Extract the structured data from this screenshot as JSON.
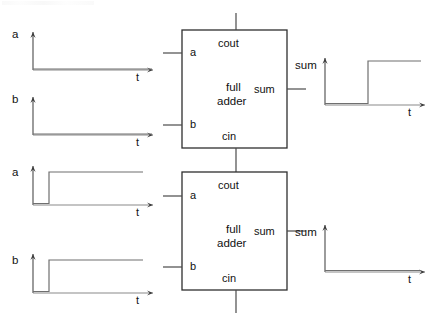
{
  "figure": {
    "title": ""
  },
  "blocks": [
    {
      "id": "full-adder-1",
      "line1": "full",
      "line2": "adder",
      "port_top": "cout",
      "port_bottom": "cin",
      "port_left_top": "a",
      "port_left_bottom": "b",
      "port_right": "sum",
      "x": 182,
      "y": 30,
      "w": 105,
      "h": 118
    },
    {
      "id": "full-adder-2",
      "line1": "full",
      "line2": "adder",
      "port_top": "cout",
      "port_bottom": "cin",
      "port_left_top": "a",
      "port_left_bottom": "b",
      "port_right": "sum",
      "x": 182,
      "y": 172,
      "w": 105,
      "h": 118
    }
  ],
  "waveforms": [
    {
      "id": "wave-a-top",
      "signal_label": "a",
      "time_label": "t",
      "level": "low",
      "description": "a stays low for all t",
      "ox": 33,
      "oy": 70,
      "axis_len_x": 120,
      "axis_len_y": 38,
      "points": [
        [
          0,
          0
        ],
        [
          120,
          0
        ]
      ]
    },
    {
      "id": "wave-b-top",
      "signal_label": "b",
      "time_label": "t",
      "level": "low",
      "description": "b stays low for all t",
      "ox": 33,
      "oy": 135,
      "axis_len_x": 120,
      "axis_len_y": 38,
      "points": [
        [
          0,
          0
        ],
        [
          120,
          0
        ]
      ]
    },
    {
      "id": "wave-a-bottom",
      "signal_label": "a",
      "time_label": "t",
      "level": "step-up",
      "description": "a rises from low to high",
      "ox": 33,
      "oy": 205,
      "axis_len_x": 120,
      "axis_len_y": 38,
      "points": [
        [
          0,
          0
        ],
        [
          16,
          0
        ],
        [
          16,
          33
        ],
        [
          110,
          33
        ]
      ]
    },
    {
      "id": "wave-b-bottom",
      "signal_label": "b",
      "time_label": "t",
      "level": "step-up",
      "description": "b rises from low to high",
      "ox": 33,
      "oy": 293,
      "axis_len_x": 120,
      "axis_len_y": 38,
      "points": [
        [
          0,
          0
        ],
        [
          16,
          0
        ],
        [
          16,
          33
        ],
        [
          110,
          33
        ]
      ]
    },
    {
      "id": "wave-sum-top",
      "signal_label": "sum",
      "time_label": "t",
      "level": "step-up-late",
      "description": "sum rises from low to high at mid time",
      "ox": 325,
      "oy": 105,
      "axis_len_x": 100,
      "axis_len_y": 44,
      "points": [
        [
          0,
          0
        ],
        [
          43,
          0
        ],
        [
          43,
          44
        ],
        [
          96,
          44
        ]
      ]
    },
    {
      "id": "wave-sum-bottom",
      "signal_label": "sum",
      "time_label": "t",
      "level": "low",
      "description": "sum stays low for all t",
      "ox": 325,
      "oy": 272,
      "axis_len_x": 100,
      "axis_len_y": 44,
      "points": [
        [
          0,
          0
        ],
        [
          100,
          0
        ]
      ]
    }
  ],
  "wires": [
    {
      "id": "wire-a-in-1",
      "name": "input-a-stub-adder-1"
    },
    {
      "id": "wire-b-in-1",
      "name": "input-b-stub-adder-1"
    },
    {
      "id": "wire-a-in-2",
      "name": "input-a-stub-adder-2"
    },
    {
      "id": "wire-b-in-2",
      "name": "input-b-stub-adder-2"
    },
    {
      "id": "wire-cout-1",
      "name": "cout-stub-adder-1"
    },
    {
      "id": "wire-carry",
      "name": "carry-chain-adder1-cin-to-adder2-cout"
    },
    {
      "id": "wire-cin-2",
      "name": "cin-stub-adder-2"
    },
    {
      "id": "wire-sum-1",
      "name": "sum-stub-adder-1"
    },
    {
      "id": "wire-sum-2",
      "name": "sum-stub-adder-2"
    }
  ],
  "colors": {
    "stroke": "#4a4a4a",
    "block_stroke": "#2e2e2e",
    "text": "#111111",
    "background": "#ffffff"
  }
}
